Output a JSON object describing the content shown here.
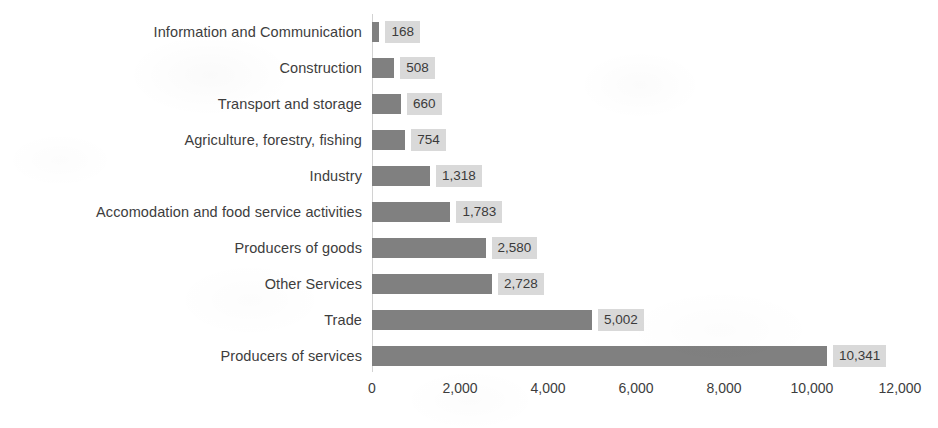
{
  "chart_data": {
    "type": "bar",
    "orientation": "horizontal",
    "title": "",
    "subtitle": "",
    "xlabel": "",
    "ylabel": "",
    "xlim": [
      0,
      12000
    ],
    "xticks": [
      0,
      2000,
      4000,
      6000,
      8000,
      10000,
      12000
    ],
    "xtick_labels": [
      "0",
      "2,000",
      "4,000",
      "6,000",
      "8,000",
      "10,000",
      "12,000"
    ],
    "grid": false,
    "legend": false,
    "legend_position": "none",
    "data_labels_shown": true,
    "categories": [
      "Information and Communication",
      "Construction",
      "Transport and storage",
      "Agriculture, forestry, fishing",
      "Industry",
      "Accomodation and food service activities",
      "Producers of goods",
      "Other Services",
      "Trade",
      "Producers of services"
    ],
    "values": [
      168,
      508,
      660,
      754,
      1318,
      1783,
      2580,
      2728,
      5002,
      10341
    ],
    "value_labels": [
      "168",
      "508",
      "660",
      "754",
      "1,318",
      "1,783",
      "2,580",
      "2,728",
      "5,002",
      "10,341"
    ],
    "colors": {
      "bar": "#808080",
      "data_label_background": "#d9d9d9",
      "text": "#3d3d3d",
      "axis_line": "#d2d2d2",
      "background": "#ffffff"
    }
  }
}
